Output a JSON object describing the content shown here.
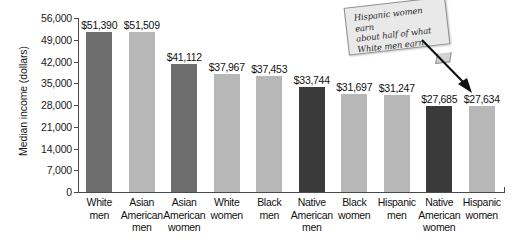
{
  "chart_data": {
    "type": "bar",
    "title": "",
    "xlabel": "",
    "ylabel": "Median income (dollars)",
    "ylim": [
      0,
      56000
    ],
    "ytick_step": 7000,
    "grid": false,
    "legend": null,
    "categories": [
      "White men",
      "Asian American men",
      "Asian American women",
      "White women",
      "Black men",
      "Native American men",
      "Black women",
      "Hispanic men",
      "Native American women",
      "Hispanic women"
    ],
    "category_lines": [
      [
        "White",
        "men"
      ],
      [
        "Asian",
        "American",
        "men"
      ],
      [
        "Asian",
        "American",
        "women"
      ],
      [
        "White",
        "women"
      ],
      [
        "Black",
        "men"
      ],
      [
        "Native",
        "American",
        "men"
      ],
      [
        "Black",
        "women"
      ],
      [
        "Hispanic",
        "men"
      ],
      [
        "Native",
        "American",
        "women"
      ],
      [
        "Hispanic",
        "women"
      ]
    ],
    "values": [
      51390,
      51509,
      41112,
      37967,
      37453,
      33744,
      31697,
      31247,
      27685,
      27634
    ],
    "value_labels": [
      "$51,390",
      "$51,509",
      "$41,112",
      "$37,967",
      "$37,453",
      "$33,744",
      "$31,697",
      "$31,247",
      "$27,685",
      "$27,634"
    ],
    "bar_shades": [
      "dark",
      "light",
      "dark",
      "light",
      "light",
      "darkest",
      "light",
      "light",
      "darkest",
      "light"
    ],
    "ytick_labels": [
      "56,000",
      "49,000",
      "42,000",
      "35,000",
      "28,000",
      "21,000",
      "14,000",
      "7,000",
      "0"
    ],
    "ytick_values": [
      56000,
      49000,
      42000,
      35000,
      28000,
      21000,
      14000,
      7000,
      0
    ],
    "annotations": [
      {
        "text": "Hispanic women earn about half of what White men earn.",
        "lines": [
          "Hispanic women earn",
          "about half of what",
          "White men earn."
        ],
        "points_to": "Hispanic women"
      }
    ],
    "colors": {
      "bar_dark": "#6e6e6e",
      "bar_light": "#b7b7b7",
      "bar_darkest": "#3a3a3a",
      "axis": "#4a4a4a",
      "note_bg": "#e9e9e9",
      "background": "#ffffff"
    }
  }
}
